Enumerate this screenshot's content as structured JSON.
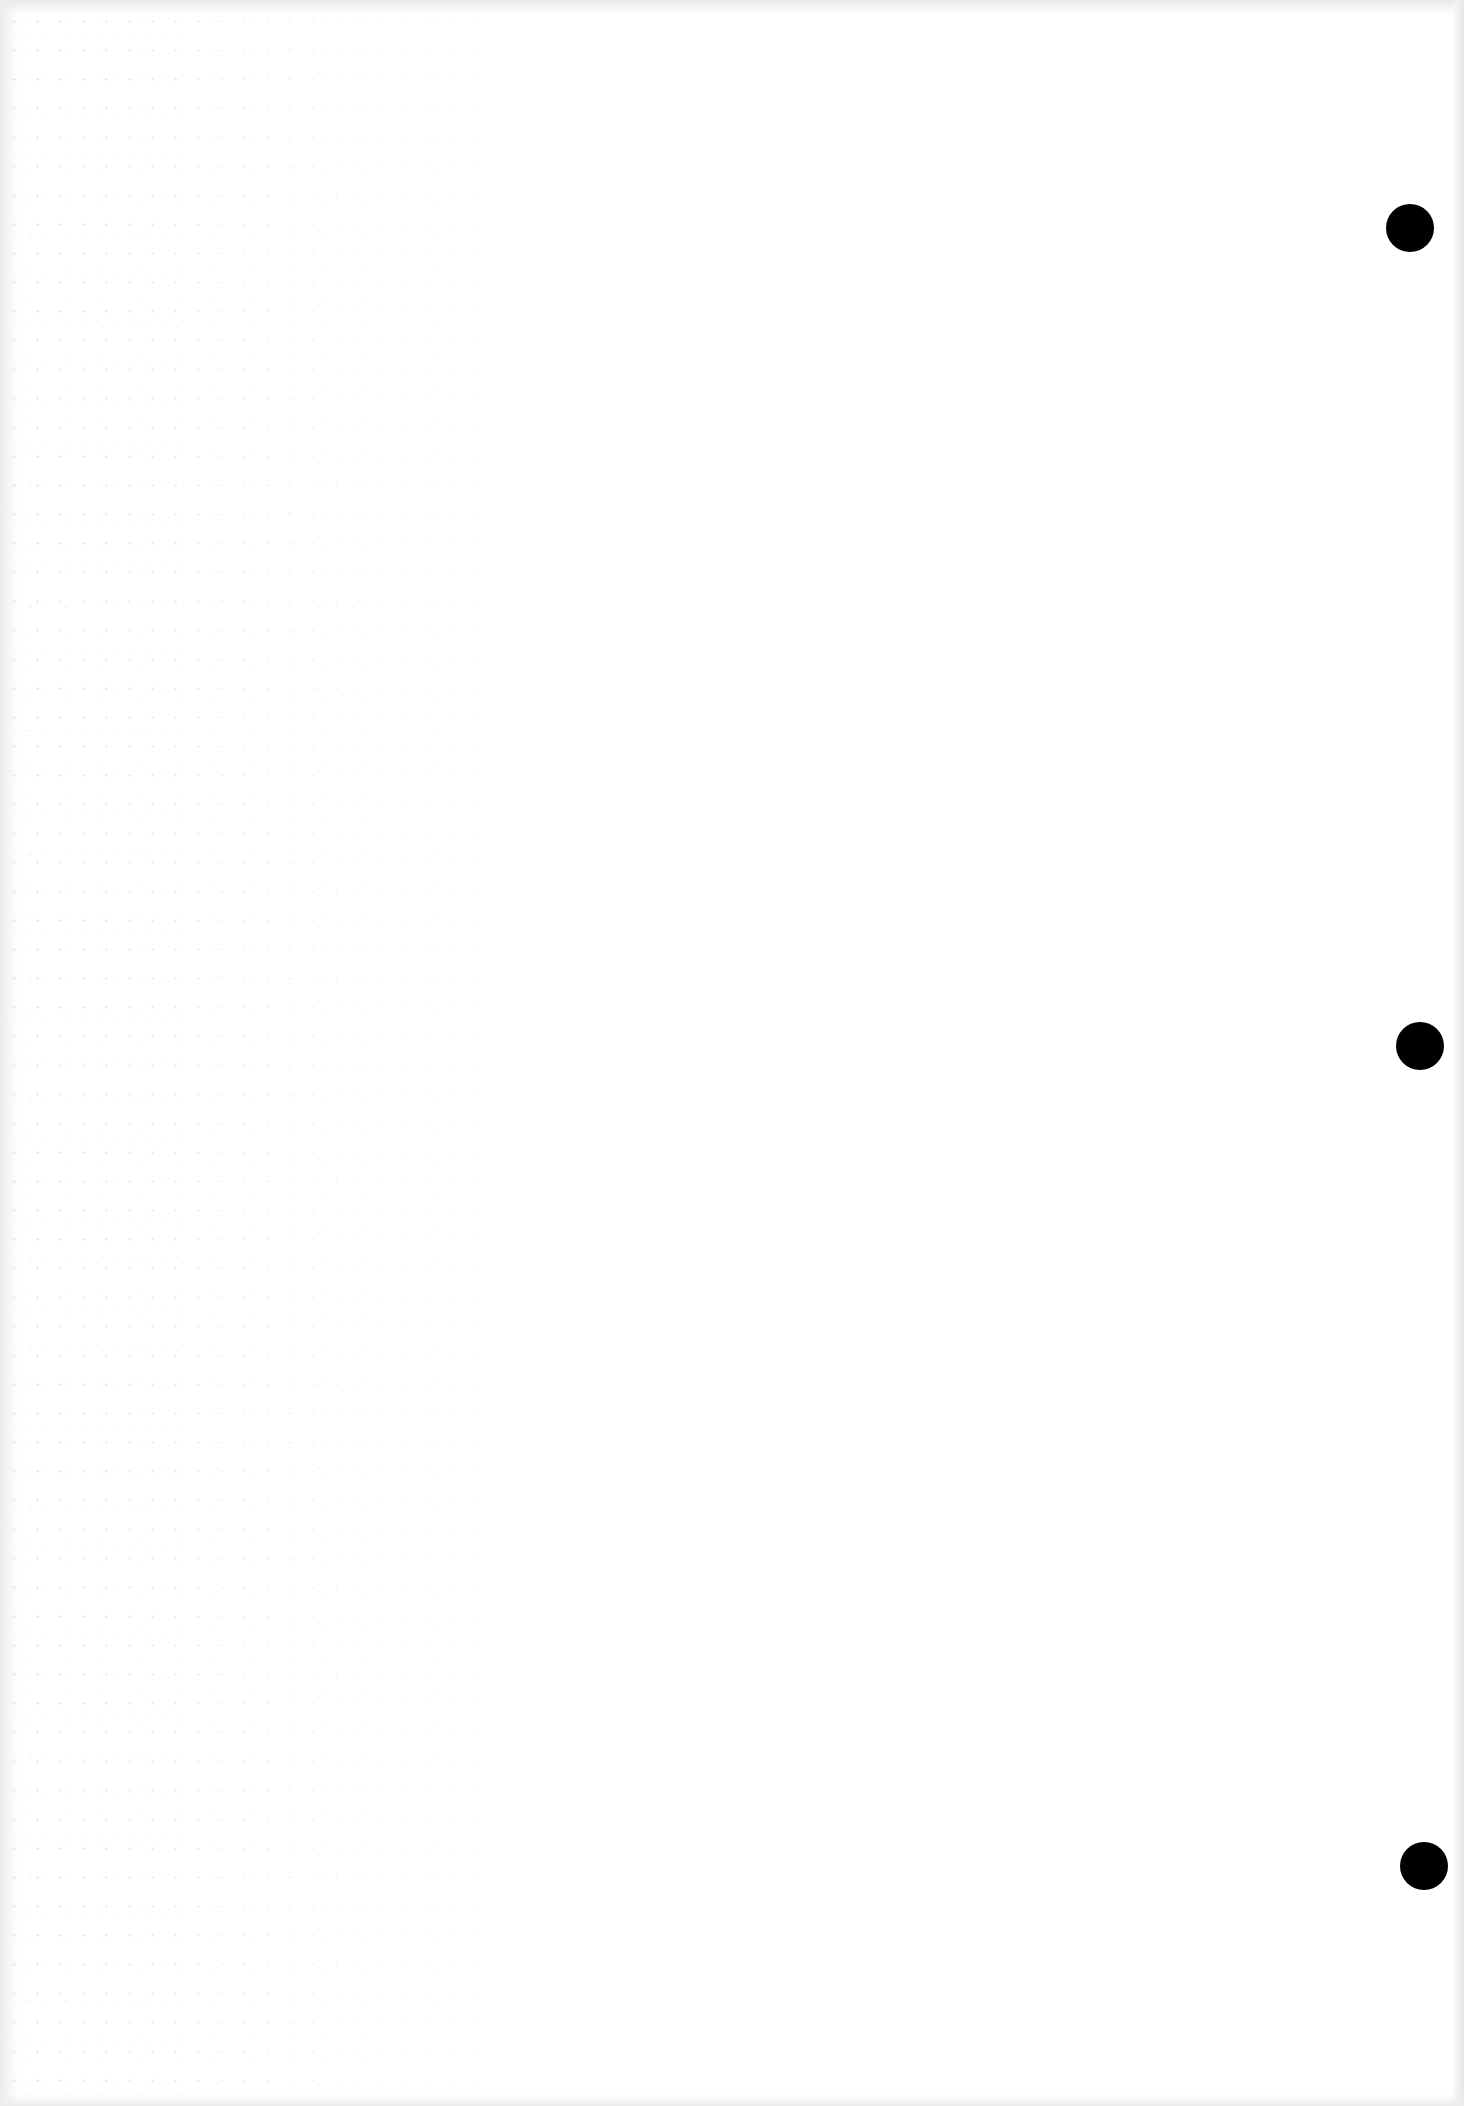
{
  "document": {
    "type": "blank scanned page",
    "background_color": "#ffffff",
    "text_content": ""
  },
  "punch_holes": [
    {
      "cx": 1410,
      "cy": 228,
      "r": 24,
      "color": "#000000"
    },
    {
      "cx": 1420,
      "cy": 1046,
      "r": 24,
      "color": "#000000"
    },
    {
      "cx": 1424,
      "cy": 1866,
      "r": 24,
      "color": "#000000"
    }
  ]
}
